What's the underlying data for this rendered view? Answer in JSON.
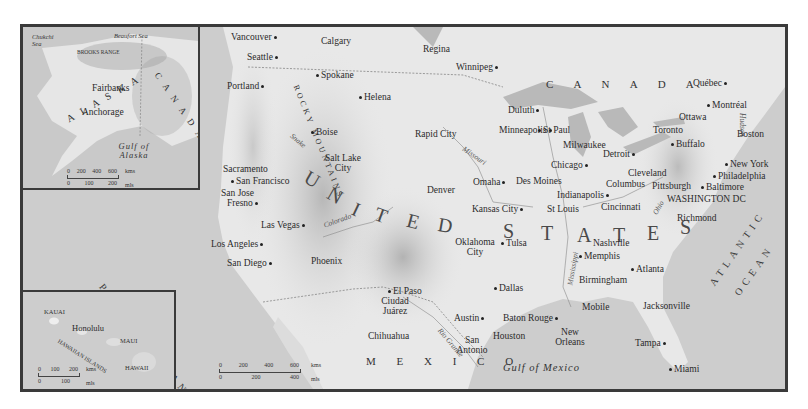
{
  "map": {
    "title": "United States and neighboring regions",
    "colors": {
      "frame": "#3a3a3a",
      "land": "#e6e6e6",
      "water": "#c8c8c8",
      "mountains": "#9a9a9a"
    },
    "regions": {
      "canada": "C A N A D A",
      "united_states": [
        "U",
        "N",
        "I",
        "T",
        "E",
        "D",
        "S",
        "T",
        "A",
        "T",
        "E",
        "S"
      ],
      "mexico": "M E X I C O",
      "pacific": "PACIFIC OCEAN",
      "atlantic_1": "ATLANTIC",
      "atlantic_2": "OCEAN",
      "gulf": "Gulf of Mexico",
      "rocky": "ROCKY MOUNTAINS"
    },
    "rivers": [
      "Snake",
      "Colorado",
      "Missouri",
      "Mississippi",
      "Ohio",
      "Rio Grande",
      "Hudson"
    ],
    "cities": [
      {
        "name": "Vancouver",
        "x": 232,
        "y": 10,
        "dot": "right"
      },
      {
        "name": "Calgary",
        "x": 304,
        "y": 12,
        "dot": "above"
      },
      {
        "name": "Regina",
        "x": 403,
        "y": 22,
        "dot": "below"
      },
      {
        "name": "Winnipeg",
        "x": 435,
        "y": 40,
        "dot": "right"
      },
      {
        "name": "Seattle",
        "x": 223,
        "y": 30,
        "dot": "right"
      },
      {
        "name": "Spokane",
        "x": 294,
        "y": 46,
        "dot": "left"
      },
      {
        "name": "Portland",
        "x": 207,
        "y": 56,
        "dot": "right"
      },
      {
        "name": "Helena",
        "x": 336,
        "y": 70,
        "dot": "left"
      },
      {
        "name": "Boise",
        "x": 289,
        "y": 100,
        "dot": "left"
      },
      {
        "name": "Rapid City",
        "x": 390,
        "y": 106,
        "dot": "below"
      },
      {
        "name": "Minneapolis",
        "x": 474,
        "y": 102,
        "dot": "right"
      },
      {
        "name": "St Paul",
        "x": 513,
        "y": 102,
        "dot": "left"
      },
      {
        "name": "Duluth",
        "x": 488,
        "y": 82,
        "dot": "right"
      },
      {
        "name": "Salt Lake City",
        "x": 292,
        "y": 137,
        "dot": "below"
      },
      {
        "name": "Denver",
        "x": 398,
        "y": 160,
        "dot": "below"
      },
      {
        "name": "Omaha",
        "x": 448,
        "y": 150,
        "dot": "right"
      },
      {
        "name": "Des Moines",
        "x": 490,
        "y": 146,
        "dot": "above"
      },
      {
        "name": "Kansas City",
        "x": 446,
        "y": 178,
        "dot": "right"
      },
      {
        "name": "St Louis",
        "x": 522,
        "y": 178,
        "dot": "below"
      },
      {
        "name": "Chicago",
        "x": 548,
        "y": 134,
        "dot": "right"
      },
      {
        "name": "Milwaukee",
        "x": 558,
        "y": 112,
        "dot": "below"
      },
      {
        "name": "Detroit",
        "x": 598,
        "y": 123,
        "dot": "right"
      },
      {
        "name": "Toronto",
        "x": 649,
        "y": 99,
        "dot": "below"
      },
      {
        "name": "Buffalo",
        "x": 668,
        "y": 113,
        "dot": "left"
      },
      {
        "name": "Ottawa",
        "x": 678,
        "y": 78,
        "dot": "above"
      },
      {
        "name": "Montréal",
        "x": 702,
        "y": 67,
        "dot": "left"
      },
      {
        "name": "Québec",
        "x": 690,
        "y": 44,
        "dot": "right"
      },
      {
        "name": "Boston",
        "x": 733,
        "y": 100,
        "dot": "below"
      },
      {
        "name": "New York",
        "x": 722,
        "y": 130,
        "dot": "left"
      },
      {
        "name": "Philadelphia",
        "x": 713,
        "y": 142,
        "dot": "left"
      },
      {
        "name": "Baltimore",
        "x": 700,
        "y": 153,
        "dot": "left"
      },
      {
        "name": "WASHINGTON DC",
        "x": 665,
        "y": 166,
        "dot": "above"
      },
      {
        "name": "Richmond",
        "x": 680,
        "y": 188,
        "dot": "above"
      },
      {
        "name": "Pittsburgh",
        "x": 656,
        "y": 153,
        "dot": "above"
      },
      {
        "name": "Cleveland",
        "x": 625,
        "y": 141,
        "dot": "above"
      },
      {
        "name": "Columbus",
        "x": 604,
        "y": 151,
        "dot": "below"
      },
      {
        "name": "Indianapolis",
        "x": 560,
        "y": 161,
        "dot": "right"
      },
      {
        "name": "Cincinnati",
        "x": 598,
        "y": 175,
        "dot": "above"
      },
      {
        "name": "Nashville",
        "x": 588,
        "y": 210,
        "dot": "above"
      },
      {
        "name": "Memphis",
        "x": 568,
        "y": 224,
        "dot": "left"
      },
      {
        "name": "Atlanta",
        "x": 628,
        "y": 238,
        "dot": "left"
      },
      {
        "name": "Birmingham",
        "x": 586,
        "y": 247,
        "dot": "above"
      },
      {
        "name": "Oklahoma City",
        "x": 432,
        "y": 213,
        "dot": "right"
      },
      {
        "name": "Tulsa",
        "x": 494,
        "y": 211,
        "dot": "left"
      },
      {
        "name": "Dallas",
        "x": 491,
        "y": 256,
        "dot": "left"
      },
      {
        "name": "El Paso",
        "x": 386,
        "y": 258,
        "dot": "left"
      },
      {
        "name": "Ciudad Juárez",
        "x": 368,
        "y": 264,
        "dot": "none"
      },
      {
        "name": "Chihuahua",
        "x": 365,
        "y": 296,
        "dot": "above"
      },
      {
        "name": "Monterrey",
        "x": 403,
        "y": 374,
        "dot": "right"
      },
      {
        "name": "Austin",
        "x": 451,
        "y": 284,
        "dot": "right"
      },
      {
        "name": "San Antonio",
        "x": 462,
        "y": 306,
        "dot": "above"
      },
      {
        "name": "Houston",
        "x": 490,
        "y": 300,
        "dot": "above"
      },
      {
        "name": "Baton Rouge",
        "x": 500,
        "y": 284,
        "dot": "right"
      },
      {
        "name": "New Orleans",
        "x": 560,
        "y": 296,
        "dot": "above"
      },
      {
        "name": "Mobile",
        "x": 600,
        "y": 282,
        "dot": "below"
      },
      {
        "name": "Jacksonville",
        "x": 640,
        "y": 279,
        "dot": "below"
      },
      {
        "name": "Tampa",
        "x": 634,
        "y": 306,
        "dot": "right"
      },
      {
        "name": "Miami",
        "x": 668,
        "y": 334,
        "dot": "left"
      },
      {
        "name": "Phoenix",
        "x": 306,
        "y": 256,
        "dot": "below"
      },
      {
        "name": "Las Vegas",
        "x": 258,
        "y": 216,
        "dot": "right"
      },
      {
        "name": "Los Angeles",
        "x": 208,
        "y": 238,
        "dot": "right"
      },
      {
        "name": "San Diego",
        "x": 224,
        "y": 256,
        "dot": "right"
      },
      {
        "name": "Sacramento",
        "x": 226,
        "y": 165,
        "dot": "below"
      },
      {
        "name": "San Francisco",
        "x": 228,
        "y": 177,
        "dot": "left"
      },
      {
        "name": "San Jose",
        "x": 219,
        "y": 187,
        "dot": "above"
      },
      {
        "name": "Fresno",
        "x": 225,
        "y": 198,
        "dot": "right"
      }
    ]
  },
  "alaska_inset": {
    "labels": {
      "chukchi": "Chukchi Sea",
      "beaufort": "Beaufort Sea",
      "brooks": "BROOKS RANGE",
      "alaska": "A L A S K A",
      "canada": "C A N A D A",
      "fairbanks": "Fairbanks",
      "anchorage": "Anchorage",
      "gulf": "Gulf of Alaska"
    },
    "scale": {
      "km_ticks": [
        "0",
        "200",
        "400",
        "600"
      ],
      "km_unit": "kms",
      "mi_ticks": [
        "0",
        "100",
        "200"
      ],
      "mi_unit": "mls"
    }
  },
  "hawaii_inset": {
    "labels": {
      "kauai": "KAUAI",
      "honolulu": "Honolulu",
      "islands": "HAWAIIAN ISLANDS",
      "maui": "MAUI",
      "hawaii": "HAWAII"
    },
    "scale": {
      "km_ticks": [
        "0",
        "100",
        "200"
      ],
      "km_unit": "kms",
      "mi_ticks": [
        "0",
        "100"
      ],
      "mi_unit": "mls"
    }
  },
  "main_scale": {
    "km_ticks": [
      "0",
      "200",
      "400",
      "600"
    ],
    "km_unit": "kms",
    "mi_ticks": [
      "0",
      "200",
      "400"
    ],
    "mi_unit": "mls"
  }
}
